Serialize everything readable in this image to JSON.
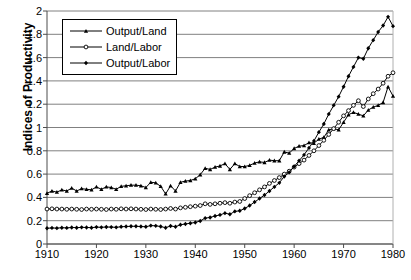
{
  "chart_data": {
    "type": "line",
    "title": "",
    "xlabel": "",
    "ylabel": "Indices of Productivity",
    "xlim": [
      1910,
      1980
    ],
    "ylim": [
      0,
      2
    ],
    "xticks": [
      1910,
      1920,
      1930,
      1940,
      1950,
      1960,
      1970,
      1980
    ],
    "yticks": [
      0,
      0.2,
      0.4,
      0.6,
      0.8,
      1,
      1.2,
      1.4,
      1.6,
      1.8,
      2
    ],
    "ytick_labels": [
      "0",
      "0.2",
      "0.4",
      "0.6",
      "0.8",
      "1",
      "1.2",
      "1.4",
      "1.6",
      "1.8",
      "2"
    ],
    "xtick_labels": [
      "1910",
      "1920",
      "1930",
      "1940",
      "1950",
      "1960",
      "1970",
      "1980"
    ],
    "grid": "horizontal",
    "legend_position": "top-left",
    "x": [
      1910,
      1911,
      1912,
      1913,
      1914,
      1915,
      1916,
      1917,
      1918,
      1919,
      1920,
      1921,
      1922,
      1923,
      1924,
      1925,
      1926,
      1927,
      1928,
      1929,
      1930,
      1931,
      1932,
      1933,
      1934,
      1935,
      1936,
      1937,
      1938,
      1939,
      1940,
      1941,
      1942,
      1943,
      1944,
      1945,
      1946,
      1947,
      1948,
      1949,
      1950,
      1951,
      1952,
      1953,
      1954,
      1955,
      1956,
      1957,
      1958,
      1959,
      1960,
      1961,
      1962,
      1963,
      1964,
      1965,
      1966,
      1967,
      1968,
      1969,
      1970,
      1971,
      1972,
      1973,
      1974,
      1975,
      1976,
      1977,
      1978,
      1979,
      1980
    ],
    "series": [
      {
        "name": "Output/Land",
        "marker": "filled-triangle",
        "values": [
          0.435,
          0.455,
          0.445,
          0.465,
          0.455,
          0.48,
          0.455,
          0.475,
          0.47,
          0.465,
          0.49,
          0.47,
          0.49,
          0.485,
          0.47,
          0.495,
          0.5,
          0.505,
          0.505,
          0.5,
          0.485,
          0.53,
          0.525,
          0.495,
          0.43,
          0.5,
          0.455,
          0.53,
          0.54,
          0.545,
          0.56,
          0.595,
          0.65,
          0.64,
          0.66,
          0.67,
          0.69,
          0.64,
          0.69,
          0.665,
          0.665,
          0.675,
          0.695,
          0.705,
          0.7,
          0.72,
          0.715,
          0.715,
          0.79,
          0.78,
          0.82,
          0.84,
          0.845,
          0.87,
          0.865,
          0.9,
          0.915,
          0.98,
          0.99,
          0.98,
          1.045,
          1.11,
          1.13,
          1.115,
          1.1,
          1.15,
          1.175,
          1.19,
          1.215,
          1.35,
          1.27
        ]
      },
      {
        "name": "Land/Labor",
        "marker": "open-circle",
        "values": [
          0.3,
          0.302,
          0.3,
          0.3,
          0.298,
          0.3,
          0.298,
          0.296,
          0.3,
          0.298,
          0.3,
          0.298,
          0.296,
          0.3,
          0.298,
          0.302,
          0.3,
          0.302,
          0.3,
          0.298,
          0.296,
          0.3,
          0.298,
          0.296,
          0.3,
          0.305,
          0.3,
          0.31,
          0.315,
          0.32,
          0.325,
          0.33,
          0.345,
          0.34,
          0.345,
          0.35,
          0.355,
          0.35,
          0.36,
          0.365,
          0.39,
          0.415,
          0.44,
          0.465,
          0.49,
          0.52,
          0.545,
          0.57,
          0.6,
          0.625,
          0.66,
          0.69,
          0.72,
          0.76,
          0.8,
          0.845,
          0.89,
          0.94,
          0.99,
          1.045,
          1.1,
          1.145,
          1.19,
          1.23,
          1.18,
          1.245,
          1.29,
          1.33,
          1.38,
          1.44,
          1.47
        ]
      },
      {
        "name": "Output/Labor",
        "marker": "filled-diamond",
        "values": [
          0.135,
          0.138,
          0.136,
          0.14,
          0.138,
          0.142,
          0.14,
          0.143,
          0.142,
          0.14,
          0.145,
          0.143,
          0.146,
          0.145,
          0.143,
          0.148,
          0.15,
          0.152,
          0.152,
          0.15,
          0.148,
          0.158,
          0.156,
          0.15,
          0.14,
          0.155,
          0.148,
          0.165,
          0.172,
          0.178,
          0.185,
          0.198,
          0.222,
          0.228,
          0.24,
          0.25,
          0.265,
          0.255,
          0.28,
          0.285,
          0.305,
          0.33,
          0.36,
          0.39,
          0.42,
          0.455,
          0.49,
          0.525,
          0.58,
          0.615,
          0.665,
          0.715,
          0.765,
          0.825,
          0.885,
          0.96,
          1.03,
          1.115,
          1.19,
          1.265,
          1.35,
          1.44,
          1.52,
          1.6,
          1.59,
          1.68,
          1.75,
          1.82,
          1.875,
          1.95,
          1.87
        ]
      }
    ]
  }
}
